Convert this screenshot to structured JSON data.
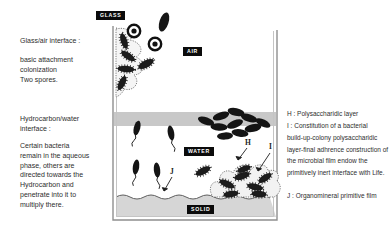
{
  "figure": {
    "type": "scientific-diagram",
    "background": "#ffffff"
  },
  "left_panel": {
    "glass_air": {
      "title": "Glass/air interface :",
      "body": "basic attachment\ncolonization\nTwo spores."
    },
    "hydrocarbon_water": {
      "title": "Hydrocarbon/water\ninterface :",
      "body": "Certain bacteria\nremain in the aqueous\nphase, others are\ndirected towards the\nHydrocarbon and\npenetrate into it to\nmultiply there."
    }
  },
  "diagram": {
    "zone_labels": {
      "glass": "GLASS",
      "air": "AIR",
      "water": "WATER",
      "solid": "SOLID"
    },
    "markers": {
      "h": "H",
      "i": "I",
      "j": "J"
    },
    "colors": {
      "hydrocarbon_band": "#c8c8c8",
      "solid_fill": "#d6d6d6",
      "zone_label_bg": "#0b0b0b",
      "zone_label_fg": "#ffffff",
      "bacteria": "#1c1c1c",
      "vessel_wall": "#8f8f8f"
    }
  },
  "right_panel": {
    "h_definition": "H : Polysaccharidic layer",
    "i_definition": "I : Constitution of a bacterial\nbuild-up-colony polysaccharidic\nlayer-final adhrence construction of\nthe microbial film endow the\nprimitively inert interface with Life.",
    "j_definition": "J : Organomineral primitive film"
  }
}
